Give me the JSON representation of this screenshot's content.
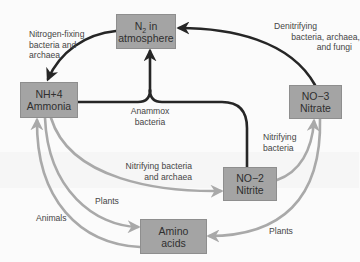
{
  "diagram": {
    "colors": {
      "background": "#fbfbfb",
      "box_fill": "#a4a4a4",
      "box_border": "#8e8e8e",
      "box_text": "#2f2f2f",
      "dark_path": "#262626",
      "light_path": "#a9a9a9",
      "label_text": "#454545"
    },
    "nodes": {
      "n2": {
        "formula_main": "N",
        "formula_sub": "2",
        "formula_suffix": " in",
        "name": "atmosphere"
      },
      "nh4": {
        "formula_main": "NH",
        "formula_sup": "+",
        "formula_sub": "4",
        "name": "Ammonia"
      },
      "no3": {
        "formula_main": "NO",
        "formula_sup": "−",
        "formula_sub": "3",
        "name": "Nitrate"
      },
      "no2": {
        "formula_main": "NO",
        "formula_sup": "−",
        "formula_sub": "2",
        "name": "Nitrite"
      },
      "amino": {
        "line1": "Amino",
        "line2": "acids"
      }
    },
    "edges": {
      "nitrogen_fixing": {
        "lines": [
          "Nitrogen-fixing",
          "bacteria and",
          "archaea"
        ],
        "from": "N2 in atmosphere",
        "to": "NH4+ Ammonia"
      },
      "denitrifying": {
        "lines": [
          "Denitrifying",
          "bacteria, archaea,",
          "and fungi"
        ],
        "from": "NO3- Nitrate",
        "to": "N2 in atmosphere"
      },
      "anammox": {
        "lines": [
          "Anammox",
          "bacteria"
        ],
        "from": "NH4+ Ammonia + NO2- Nitrite",
        "to": "N2 in atmosphere"
      },
      "nitrifying_bacteria": {
        "lines": [
          "Nitrifying",
          "bacteria"
        ],
        "from": "NO2- Nitrite",
        "to": "NO3- Nitrate"
      },
      "nitrifying_bacteria_archaea": {
        "lines": [
          "Nitrifying bacteria",
          "and archaea"
        ],
        "from": "NH4+ Ammonia",
        "to": "NO2- Nitrite"
      },
      "plants_nh4": {
        "lines": [
          "Plants"
        ],
        "from": "NH4+ Ammonia",
        "to": "Amino acids"
      },
      "animals": {
        "lines": [
          "Animals"
        ],
        "from": "Amino acids",
        "to": "NH4+ Ammonia"
      },
      "plants_no3": {
        "lines": [
          "Plants"
        ],
        "from": "NO3- Nitrate",
        "to": "Amino acids"
      }
    }
  }
}
